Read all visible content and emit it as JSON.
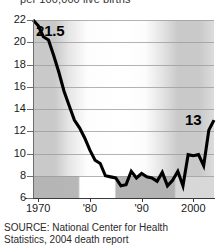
{
  "caption": {
    "top": "per 100,000 live births"
  },
  "source": {
    "line1": "SOURCE: National Center for Health",
    "line2": "Statistics, 2004 death report"
  },
  "annotations": {
    "start_value": "21.5",
    "end_value": "13"
  },
  "axis": {
    "y_ticks": [
      "22",
      "20",
      "18",
      "16",
      "14",
      "12",
      "10",
      "8",
      "6"
    ],
    "x_ticks": [
      "1970",
      "'80",
      "'90",
      "2000"
    ]
  },
  "colors": {
    "line": "#000000",
    "grid": "#9a9a9a",
    "axis": "#3a3a3a",
    "background": "#ffffff",
    "band_shade": "#b4b4b4"
  },
  "chart_data": {
    "type": "line",
    "title": "",
    "subtitle": "per 100,000 live births",
    "xlabel": "",
    "ylabel": "per 100,000 live births",
    "xlim": [
      1969,
      2004
    ],
    "ylim": [
      6,
      22
    ],
    "grid": true,
    "legend": false,
    "x": [
      1969,
      1970,
      1971,
      1972,
      1973,
      1974,
      1975,
      1976,
      1977,
      1978,
      1979,
      1980,
      1981,
      1982,
      1983,
      1984,
      1985,
      1986,
      1987,
      1988,
      1989,
      1990,
      1991,
      1992,
      1993,
      1994,
      1995,
      1996,
      1997,
      1998,
      1999,
      2000,
      2001,
      2002,
      2003,
      2004
    ],
    "values": [
      22.0,
      21.5,
      20.5,
      20.2,
      18.8,
      17.3,
      15.6,
      14.3,
      13.0,
      12.3,
      11.4,
      10.3,
      9.4,
      9.1,
      8.0,
      7.9,
      7.8,
      7.1,
      7.2,
      8.4,
      7.8,
      8.2,
      7.9,
      7.8,
      7.5,
      8.3,
      7.1,
      7.6,
      8.4,
      7.1,
      9.9,
      9.8,
      9.9,
      8.9,
      12.1,
      13.0
    ],
    "series": [
      {
        "name": "Maternal mortality rate",
        "values": [
          22.0,
          21.5,
          20.5,
          20.2,
          18.8,
          17.3,
          15.6,
          14.3,
          13.0,
          12.3,
          11.4,
          10.3,
          9.4,
          9.1,
          8.0,
          7.9,
          7.8,
          7.1,
          7.2,
          8.4,
          7.8,
          8.2,
          7.9,
          7.8,
          7.5,
          8.3,
          7.1,
          7.6,
          8.4,
          7.1,
          9.9,
          9.8,
          9.9,
          8.9,
          12.1,
          13.0
        ]
      }
    ],
    "point_labels": [
      {
        "x": 1970,
        "y": 21.5,
        "text": "21.5"
      },
      {
        "x": 2004,
        "y": 13.0,
        "text": "13"
      }
    ]
  }
}
